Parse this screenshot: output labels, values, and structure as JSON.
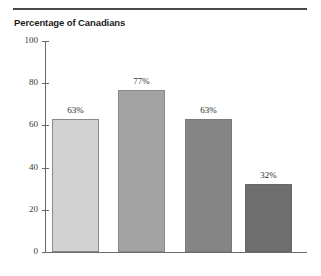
{
  "chart_data": {
    "type": "bar",
    "title": "Percentage of Canadians",
    "xlabel": "",
    "ylabel": "",
    "categories": [
      "",
      "",
      "",
      ""
    ],
    "values": [
      63,
      77,
      63,
      32
    ],
    "data_labels": [
      "63%",
      "77%",
      "63%",
      "32%"
    ],
    "ylim": [
      0,
      100
    ],
    "yticks": [
      0,
      20,
      40,
      60,
      80,
      100
    ],
    "ytick_labels": [
      "0",
      "20",
      "40",
      "60",
      "80",
      "100"
    ],
    "grid": false,
    "legend": false,
    "bar_colors": [
      "#d2d2d2",
      "#a3a3a3",
      "#858585",
      "#6e6e6e"
    ],
    "bar_border_colors": [
      "#8a8a8a",
      "#8a8a8a",
      "#7a7a7a",
      "#676767"
    ],
    "axis_color": "#6b6b6b",
    "rule_color": "#4a4a4a"
  },
  "ticks": [
    {
      "label": "100",
      "value": 100
    },
    {
      "label": "80",
      "value": 80
    },
    {
      "label": "60",
      "value": 60
    },
    {
      "label": "40",
      "value": 40
    },
    {
      "label": "20",
      "value": 20
    },
    {
      "label": "0",
      "value": 0
    }
  ],
  "bars": [
    {
      "label": "63%",
      "value": 63
    },
    {
      "label": "77%",
      "value": 77
    },
    {
      "label": "63%",
      "value": 63
    },
    {
      "label": "32%",
      "value": 32
    }
  ]
}
